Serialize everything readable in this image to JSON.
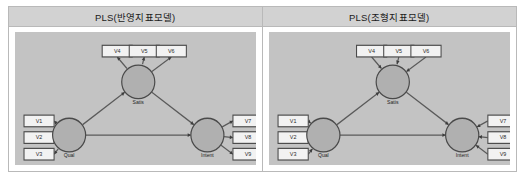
{
  "figure": {
    "panels": [
      {
        "id": "reflective",
        "title": "PLS(반영지표모델)",
        "arrow_direction": "construct-to-indicator",
        "constructs": [
          {
            "key": "quality",
            "label": "Qual",
            "cx": 36,
            "cy": 62
          },
          {
            "key": "satisfaction",
            "label": "Satis",
            "cx": 82,
            "cy": 30
          },
          {
            "key": "intent",
            "label": "Intent",
            "cx": 128,
            "cy": 62
          }
        ],
        "indicators": {
          "left": [
            {
              "label": "V1",
              "x": 6,
              "y": 50
            },
            {
              "label": "V2",
              "x": 6,
              "y": 60
            },
            {
              "label": "V3",
              "x": 6,
              "y": 70
            }
          ],
          "top": [
            {
              "label": "V4",
              "x": 58,
              "y": 8
            },
            {
              "label": "V5",
              "x": 76,
              "y": 8
            },
            {
              "label": "V6",
              "x": 94,
              "y": 8
            }
          ],
          "right": [
            {
              "label": "V7",
              "x": 145,
              "y": 50
            },
            {
              "label": "V8",
              "x": 145,
              "y": 60
            },
            {
              "label": "V9",
              "x": 145,
              "y": 70
            }
          ]
        },
        "structural_paths": [
          {
            "from": "quality",
            "to": "satisfaction"
          },
          {
            "from": "quality",
            "to": "intent"
          },
          {
            "from": "satisfaction",
            "to": "intent"
          }
        ]
      },
      {
        "id": "formative",
        "title": "PLS(조형지표모델)",
        "arrow_direction": "indicator-to-construct",
        "constructs": [
          {
            "key": "quality",
            "label": "Qual",
            "cx": 36,
            "cy": 62
          },
          {
            "key": "satisfaction",
            "label": "Satis",
            "cx": 82,
            "cy": 30
          },
          {
            "key": "intent",
            "label": "Intent",
            "cx": 128,
            "cy": 62
          }
        ],
        "indicators": {
          "left": [
            {
              "label": "V1",
              "x": 6,
              "y": 50
            },
            {
              "label": "V2",
              "x": 6,
              "y": 60
            },
            {
              "label": "V3",
              "x": 6,
              "y": 70
            }
          ],
          "top": [
            {
              "label": "V4",
              "x": 58,
              "y": 8
            },
            {
              "label": "V5",
              "x": 76,
              "y": 8
            },
            {
              "label": "V6",
              "x": 94,
              "y": 8
            }
          ],
          "right": [
            {
              "label": "V7",
              "x": 145,
              "y": 50
            },
            {
              "label": "V8",
              "x": 145,
              "y": 60
            },
            {
              "label": "V9",
              "x": 145,
              "y": 70
            }
          ]
        },
        "structural_paths": [
          {
            "from": "quality",
            "to": "satisfaction"
          },
          {
            "from": "quality",
            "to": "intent"
          },
          {
            "from": "satisfaction",
            "to": "intent"
          }
        ]
      }
    ],
    "colors": {
      "header_bg": "#d2d2d2",
      "canvas_bg": "#c3c3c3",
      "box_fill": "#f2f2f2",
      "ellipse_fill": "#b0b0b0",
      "line": "#5a5a5a",
      "border": "#b9b9b9"
    }
  }
}
